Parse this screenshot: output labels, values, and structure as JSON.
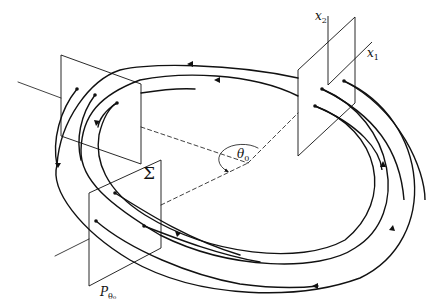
{
  "diagram": {
    "type": "poincare-section-flow",
    "labels": {
      "x2": {
        "base": "x",
        "sub": "2"
      },
      "x1": {
        "base": "x",
        "sub": "1"
      },
      "theta0": {
        "base": "θ",
        "sub": "0"
      },
      "sigma": "Σ",
      "p_theta0": {
        "base": "P",
        "sub": "θ₀"
      }
    },
    "colors": {
      "stroke": "#111111",
      "background": "#ffffff"
    },
    "planes": [
      {
        "name": "right-plane-x1x2",
        "points": [
          [
            298,
            70
          ],
          [
            355,
            17
          ],
          [
            355,
            103
          ],
          [
            298,
            156
          ]
        ]
      },
      {
        "name": "left-plane",
        "points": [
          [
            61,
            55
          ],
          [
            141,
            84
          ],
          [
            141,
            164
          ],
          [
            61,
            136
          ]
        ]
      },
      {
        "name": "sigma-plane-p-theta0",
        "points": [
          [
            89,
            193
          ],
          [
            161,
            160
          ],
          [
            161,
            248
          ],
          [
            89,
            286
          ]
        ]
      }
    ],
    "angle": {
      "center": [
        248,
        163
      ],
      "label": "θ₀"
    }
  }
}
